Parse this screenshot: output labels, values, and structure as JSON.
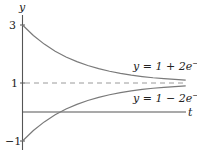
{
  "chart_data": {
    "type": "line",
    "title": "",
    "xlabel": "t",
    "ylabel": "y",
    "xlim": [
      0,
      1.5
    ],
    "ylim": [
      -1,
      3
    ],
    "yticks": [
      {
        "value": 3,
        "label": "3"
      },
      {
        "value": 1,
        "label": "1"
      },
      {
        "value": -1,
        "label": "−1"
      }
    ],
    "grid": false,
    "legend": "none (inline curve labels)",
    "asymptote": {
      "y": 1,
      "style": "dashed"
    },
    "series": [
      {
        "name": "y = 1 + 2e^{-2t}",
        "label_main": "y = 1 + 2e",
        "label_sup": "−2t",
        "color": "#7a7a7a",
        "x": [
          0,
          0.1,
          0.2,
          0.3,
          0.4,
          0.5,
          0.6,
          0.7,
          0.8,
          0.9,
          1.0,
          1.1,
          1.2,
          1.3,
          1.4,
          1.5
        ],
        "y": [
          3.0,
          2.637,
          2.341,
          2.098,
          1.899,
          1.736,
          1.602,
          1.493,
          1.404,
          1.331,
          1.271,
          1.222,
          1.181,
          1.149,
          1.122,
          1.1
        ]
      },
      {
        "name": "y = 1 - 2e^{-2t}",
        "label_main": "y = 1 − 2e",
        "label_sup": "−2t",
        "color": "#7a7a7a",
        "x": [
          0,
          0.1,
          0.2,
          0.3,
          0.4,
          0.5,
          0.6,
          0.7,
          0.8,
          0.9,
          1.0,
          1.1,
          1.2,
          1.3,
          1.4,
          1.5
        ],
        "y": [
          -1.0,
          -0.637,
          -0.341,
          -0.098,
          0.101,
          0.264,
          0.398,
          0.507,
          0.596,
          0.669,
          0.729,
          0.778,
          0.819,
          0.851,
          0.878,
          0.9
        ]
      }
    ]
  },
  "axes": {
    "y_label": "y",
    "t_label": "t",
    "tick_3": "3",
    "tick_1": "1",
    "tick_neg1": "−1"
  },
  "labels": {
    "upper_main": "y = 1 + 2e",
    "upper_sup": "−2t",
    "lower_main": "y = 1 − 2e",
    "lower_sup": "−2t"
  },
  "colors": {
    "axis": "#555555",
    "curve": "#7a7a7a",
    "dashed": "#9a9a9a",
    "text": "#222222"
  }
}
